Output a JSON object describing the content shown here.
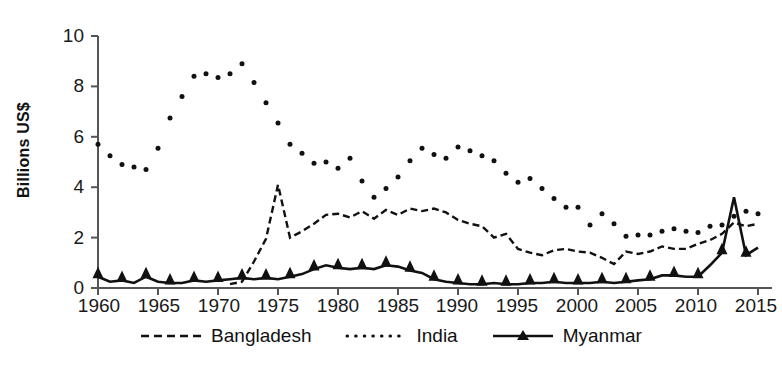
{
  "chart_data": {
    "type": "line",
    "title": "",
    "xlabel": "",
    "ylabel": "Billions US$",
    "xlim": [
      1960,
      2015
    ],
    "ylim": [
      0,
      10
    ],
    "yticks": [
      0,
      2,
      4,
      6,
      8,
      10
    ],
    "xticks": [
      1960,
      1965,
      1970,
      1975,
      1980,
      1985,
      1990,
      1995,
      2000,
      2005,
      2010,
      2015
    ],
    "grid": false,
    "legend_position": "bottom",
    "x": [
      1960,
      1961,
      1962,
      1963,
      1964,
      1965,
      1966,
      1967,
      1968,
      1969,
      1970,
      1971,
      1972,
      1973,
      1974,
      1975,
      1976,
      1977,
      1978,
      1979,
      1980,
      1981,
      1982,
      1983,
      1984,
      1985,
      1986,
      1987,
      1988,
      1989,
      1990,
      1991,
      1992,
      1993,
      1994,
      1995,
      1996,
      1997,
      1998,
      1999,
      2000,
      2001,
      2002,
      2003,
      2004,
      2005,
      2006,
      2007,
      2008,
      2009,
      2010,
      2011,
      2012,
      2013,
      2014,
      2015
    ],
    "series": [
      {
        "name": "Bangladesh",
        "style": "dashed",
        "color": "#111111",
        "values": [
          null,
          null,
          null,
          null,
          null,
          null,
          null,
          null,
          null,
          null,
          null,
          0.15,
          0.25,
          1.05,
          1.95,
          4.1,
          2.0,
          2.25,
          2.55,
          2.9,
          2.95,
          2.8,
          3.05,
          2.75,
          3.1,
          2.9,
          3.15,
          3.05,
          3.15,
          3.0,
          2.7,
          2.55,
          2.45,
          2.0,
          2.15,
          1.55,
          1.4,
          1.3,
          1.5,
          1.55,
          1.45,
          1.4,
          1.2,
          0.95,
          1.45,
          1.35,
          1.45,
          1.65,
          1.55,
          1.55,
          1.75,
          1.9,
          2.15,
          2.6,
          2.45,
          2.55
        ]
      },
      {
        "name": "India",
        "style": "dotted",
        "color": "#111111",
        "values": [
          5.7,
          5.25,
          4.9,
          4.8,
          4.7,
          5.55,
          6.75,
          7.6,
          8.4,
          8.5,
          8.35,
          8.5,
          8.9,
          8.15,
          7.35,
          6.55,
          5.7,
          5.35,
          4.95,
          5.0,
          4.75,
          5.15,
          4.25,
          3.6,
          3.95,
          4.4,
          5.05,
          5.55,
          5.3,
          5.15,
          5.6,
          5.45,
          5.25,
          5.05,
          4.55,
          4.2,
          4.35,
          3.95,
          3.55,
          3.2,
          3.2,
          2.5,
          2.95,
          2.55,
          2.05,
          2.1,
          2.1,
          2.25,
          2.35,
          2.25,
          2.2,
          2.45,
          2.5,
          2.85,
          3.05,
          2.95
        ]
      },
      {
        "name": "Myanmar",
        "style": "solid-marker",
        "color": "#111111",
        "values": [
          0.45,
          0.25,
          0.3,
          0.2,
          0.45,
          0.25,
          0.2,
          0.2,
          0.3,
          0.25,
          0.3,
          0.35,
          0.4,
          0.35,
          0.4,
          0.35,
          0.45,
          0.55,
          0.75,
          0.9,
          0.8,
          0.75,
          0.8,
          0.75,
          0.9,
          0.85,
          0.7,
          0.6,
          0.35,
          0.25,
          0.2,
          0.15,
          0.15,
          0.2,
          0.15,
          0.15,
          0.2,
          0.2,
          0.25,
          0.2,
          0.2,
          0.2,
          0.25,
          0.2,
          0.25,
          0.3,
          0.35,
          0.5,
          0.5,
          0.45,
          0.45,
          0.9,
          1.4,
          3.6,
          1.3,
          1.6
        ]
      }
    ]
  },
  "axes": {
    "ylabel": "Billions US$",
    "ytick_labels": [
      "10",
      "8",
      "6",
      "4",
      "2",
      "0"
    ],
    "xtick_labels": [
      "1960",
      "1965",
      "1970",
      "1975",
      "1980",
      "1985",
      "1990",
      "1995",
      "2000",
      "2005",
      "2010",
      "2015"
    ]
  },
  "legend": {
    "items": [
      {
        "label": "Bangladesh",
        "key": "dashed-line-key"
      },
      {
        "label": "India",
        "key": "dotted-line-key"
      },
      {
        "label": "Myanmar",
        "key": "solid-triangle-line-key"
      }
    ]
  },
  "colors": {
    "ink": "#111111",
    "axis": "#555555",
    "background": "#ffffff"
  }
}
